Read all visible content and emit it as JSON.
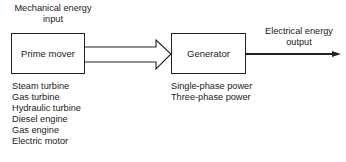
{
  "input_label": {
    "line1": "Mechanical energy",
    "line2": "input"
  },
  "output_label": {
    "line1": "Electrical energy",
    "line2": "output"
  },
  "blocks": {
    "prime_mover": {
      "label": "Prime mover"
    },
    "generator": {
      "label": "Generator"
    }
  },
  "prime_mover_types": [
    "Steam turbine",
    "Gas turbine",
    "Hydraulic turbine",
    "Diesel engine",
    "Gas engine",
    "Electric motor"
  ],
  "generator_outputs": [
    "Single-phase power",
    "Three-phase power"
  ],
  "colors": {
    "line": "#222222",
    "background": "#ffffff"
  }
}
